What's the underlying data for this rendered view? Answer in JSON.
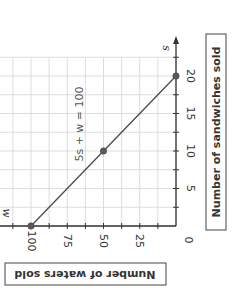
{
  "chart_data": {
    "type": "line",
    "title": "",
    "orientation_note_visible": "graph rotated 90 degrees clockwise",
    "xlabel": "Number of sandwiches sold",
    "ylabel": "Number of waters sold",
    "x_variable": "s",
    "y_variable": "w",
    "xlim": [
      0,
      22.5
    ],
    "ylim": [
      0,
      125
    ],
    "x_ticks": [
      0,
      5,
      10,
      15,
      20
    ],
    "y_ticks": [
      25,
      50,
      75,
      100
    ],
    "x_tick_labels": [
      "0",
      "5",
      "10",
      "15",
      "20"
    ],
    "y_tick_labels": [
      "25",
      "50",
      "75",
      "100"
    ],
    "grid": true,
    "series": [
      {
        "name": "5s + w = 100",
        "x": [
          0,
          10,
          20
        ],
        "y": [
          100,
          50,
          0
        ],
        "points_marked": true
      }
    ],
    "annotations": [
      {
        "text": "5s + w = 100",
        "near": {
          "s": 7,
          "w": 65
        }
      }
    ]
  },
  "labels": {
    "x_axis_title": "Number of sandwiches sold",
    "y_axis_title": "Number of waters sold",
    "x_var": "s",
    "y_var": "w",
    "equation": "5s + w = 100",
    "origin": "0"
  },
  "colors": {
    "line": "#4a4a4a",
    "point": "#595959",
    "grid": "#d4d4d4",
    "axis": "#333333"
  }
}
